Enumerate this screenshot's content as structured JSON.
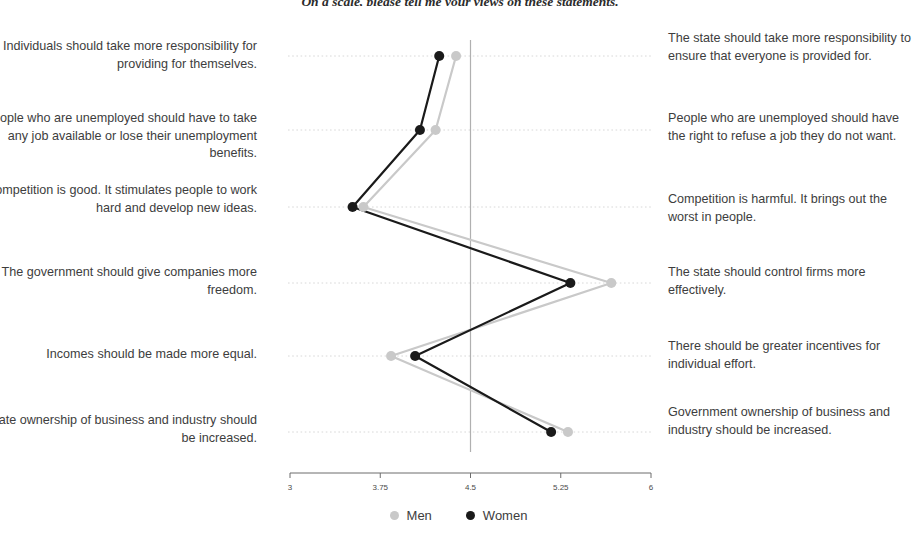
{
  "title": "On a scale, please tell me your views on these statements.",
  "legend": {
    "position": "bottom-center",
    "items": [
      {
        "label": "Men",
        "color": "#c9c9c9"
      },
      {
        "label": "Women",
        "color": "#1a1a1a"
      }
    ]
  },
  "axis": {
    "ticks": [
      "3",
      "3.75",
      "4.5",
      "5.25",
      "6"
    ],
    "min": 3,
    "max": 6,
    "reference_line": 4.5
  },
  "rows": [
    {
      "left": "Individuals should take more responsibility for providing for themselves.",
      "right": "The state should take more responsibility to ensure that everyone is provided for."
    },
    {
      "left": "People who are unemployed should have to take any job available or lose their unemployment benefits.",
      "right": "People who are unemployed should have the right to refuse a job they do not want."
    },
    {
      "left": "Competition is good. It stimulates people to work hard and develop new ideas.",
      "right": "Competition is harmful. It brings out the worst in people."
    },
    {
      "left": "The government should give companies more freedom.",
      "right": "The state should control firms more effectively."
    },
    {
      "left": "Incomes should be made more equal.",
      "right": "There should be greater incentives for individual effort."
    },
    {
      "left": "Private ownership of business and industry should be increased.",
      "right": "Government ownership of business and industry should be increased."
    }
  ],
  "chart_data": {
    "type": "line",
    "title": "On a scale, please tell me your views on these statements.",
    "xlabel": "",
    "ylabel": "",
    "xlim": [
      3,
      6
    ],
    "xticks": [
      3,
      3.75,
      4.5,
      5.25,
      6
    ],
    "grid": true,
    "reference_line_x": 4.5,
    "orientation": "horizontal-dot-plot",
    "categories": [
      "Individuals should take more responsibility for providing for themselves. / The state should take more responsibility to ensure that everyone is provided for.",
      "People who are unemployed should have to take any job available or lose their unemployment benefits. / People who are unemployed should have the right to refuse a job they do not want.",
      "Competition is good. It stimulates people to work hard and develop new ideas. / Competition is harmful. It brings out the worst in people.",
      "The government should give companies more freedom. / The state should control firms more effectively.",
      "Incomes should be made more equal. / There should be greater incentives for individual effort.",
      "Private ownership of business and industry should be increased. / Government ownership of business and industry should be increased."
    ],
    "series": [
      {
        "name": "Men",
        "color": "#c9c9c9",
        "values": [
          4.38,
          4.21,
          3.61,
          5.67,
          3.84,
          5.31
        ]
      },
      {
        "name": "Women",
        "color": "#1a1a1a",
        "values": [
          4.24,
          4.08,
          3.52,
          5.33,
          4.04,
          5.17
        ]
      }
    ]
  }
}
